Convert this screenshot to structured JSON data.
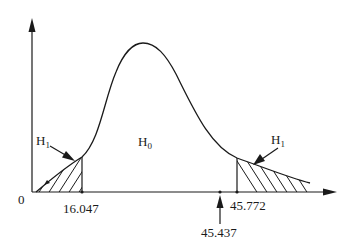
{
  "diagram": {
    "type": "chi-square-distribution-two-tailed-test",
    "origin_label": "0",
    "center_region": {
      "label": "H",
      "subscript": "0"
    },
    "left_tail": {
      "label": "H",
      "subscript": "1",
      "critical_value": "16.047"
    },
    "right_tail": {
      "label": "H",
      "subscript": "1",
      "critical_value": "45.772"
    },
    "test_statistic": {
      "value": "45.437"
    },
    "colors": {
      "stroke": "#1a1a1a",
      "background": "#ffffff"
    }
  }
}
